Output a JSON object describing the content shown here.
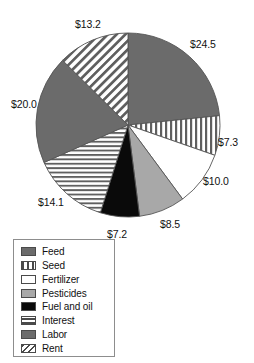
{
  "chart_data": {
    "type": "pie",
    "title": "",
    "subtitle": "",
    "xlabel": "",
    "ylabel": "",
    "legend_position": "bottom-left",
    "grid": false,
    "units": "dollars",
    "total": 104.8,
    "categories": [
      "Feed",
      "Seed",
      "Fertilizer",
      "Pesticides",
      "Fuel and oil",
      "Interest",
      "Labor",
      "Rent"
    ],
    "values": [
      24.5,
      7.3,
      10.0,
      8.5,
      7.2,
      14.1,
      20.0,
      13.2
    ],
    "slices": [
      {
        "label": "Feed",
        "value": 24.5,
        "data_label": "$24.5",
        "pattern": "solid-dark-gray",
        "color": "#6b6b6b",
        "label_x": 190,
        "label_y": 38
      },
      {
        "label": "Seed",
        "value": 7.3,
        "data_label": "$7.3",
        "pattern": "vertical-stripes",
        "color": "#ffffff",
        "label_x": 218,
        "label_y": 136
      },
      {
        "label": "Fertilizer",
        "value": 10.0,
        "data_label": "$10.0",
        "pattern": "white",
        "color": "#ffffff",
        "label_x": 203,
        "label_y": 175
      },
      {
        "label": "Pesticides",
        "value": 8.5,
        "data_label": "$8.5",
        "pattern": "solid-medium-gray",
        "color": "#a8a8a8",
        "label_x": 160,
        "label_y": 218
      },
      {
        "label": "Fuel and oil",
        "value": 7.2,
        "data_label": "$7.2",
        "pattern": "solid-black",
        "color": "#0a0a0a",
        "label_x": 107,
        "label_y": 228
      },
      {
        "label": "Interest",
        "value": 14.1,
        "data_label": "$14.1",
        "pattern": "horizontal-stripes",
        "color": "#ffffff",
        "label_x": 38,
        "label_y": 196
      },
      {
        "label": "Labor",
        "value": 20.0,
        "data_label": "$20.0",
        "pattern": "solid-dark-gray",
        "color": "#6b6b6b",
        "label_x": 11,
        "label_y": 98
      },
      {
        "label": "Rent",
        "value": 13.2,
        "data_label": "$13.2",
        "pattern": "diagonal-stripes",
        "color": "#ffffff",
        "label_x": 75,
        "label_y": 18
      }
    ]
  },
  "legend": {
    "items": [
      {
        "label": "Feed",
        "pattern": "solid-dark-gray"
      },
      {
        "label": "Seed",
        "pattern": "vertical-stripes"
      },
      {
        "label": "Fertilizer",
        "pattern": "white"
      },
      {
        "label": "Pesticides",
        "pattern": "solid-medium-gray"
      },
      {
        "label": "Fuel and oil",
        "pattern": "solid-black"
      },
      {
        "label": "Interest",
        "pattern": "horizontal-stripes"
      },
      {
        "label": "Labor",
        "pattern": "solid-dark-gray"
      },
      {
        "label": "Rent",
        "pattern": "diagonal-stripes"
      }
    ]
  },
  "style": {
    "dark_gray": "#6b6b6b",
    "medium_gray": "#a8a8a8",
    "black": "#0a0a0a",
    "white": "#ffffff",
    "outline": "#555555"
  },
  "geometry": {
    "center_x": 128,
    "center_y": 125,
    "radius": 92,
    "start_angle_deg": -90
  }
}
